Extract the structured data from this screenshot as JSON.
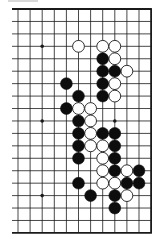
{
  "diagram": {
    "type": "go-board-partial",
    "grid": {
      "columns": 12,
      "rows": 19,
      "col_x_start": 18,
      "col_spacing": 12.1,
      "row_y_start": 9,
      "row_spacing": 12.44,
      "line_left_x": 12,
      "edges": {
        "top": true,
        "bottom": true,
        "right": true,
        "left": false
      }
    },
    "colors": {
      "line": "#1a1a1a",
      "black_stone": "#0d0d0d",
      "white_stone": "#ffffff",
      "background": "#ffffff"
    },
    "star_points": [
      [
        2,
        3
      ],
      [
        2,
        9
      ],
      [
        8,
        9
      ],
      [
        2,
        15
      ]
    ],
    "stones": {
      "white": [
        [
          5,
          3
        ],
        [
          7,
          3
        ],
        [
          8,
          3
        ],
        [
          8,
          4
        ],
        [
          9,
          5
        ],
        [
          8,
          6
        ],
        [
          8,
          7
        ],
        [
          5,
          8
        ],
        [
          6,
          8
        ],
        [
          6,
          9
        ],
        [
          6,
          10
        ],
        [
          6,
          11
        ],
        [
          7,
          11
        ],
        [
          7,
          12
        ],
        [
          7,
          13
        ],
        [
          9,
          13
        ],
        [
          7,
          14
        ],
        [
          8,
          14
        ],
        [
          9,
          15
        ]
      ],
      "black": [
        [
          7,
          4
        ],
        [
          7,
          5
        ],
        [
          8,
          5
        ],
        [
          4,
          6
        ],
        [
          7,
          6
        ],
        [
          5,
          7
        ],
        [
          7,
          7
        ],
        [
          4,
          8
        ],
        [
          5,
          9
        ],
        [
          5,
          10
        ],
        [
          7,
          10
        ],
        [
          8,
          10
        ],
        [
          5,
          11
        ],
        [
          8,
          11
        ],
        [
          5,
          12
        ],
        [
          8,
          12
        ],
        [
          8,
          13
        ],
        [
          10,
          13
        ],
        [
          5,
          14
        ],
        [
          9,
          14
        ],
        [
          10,
          14
        ],
        [
          6,
          15
        ],
        [
          8,
          15
        ],
        [
          8,
          16
        ]
      ]
    }
  }
}
